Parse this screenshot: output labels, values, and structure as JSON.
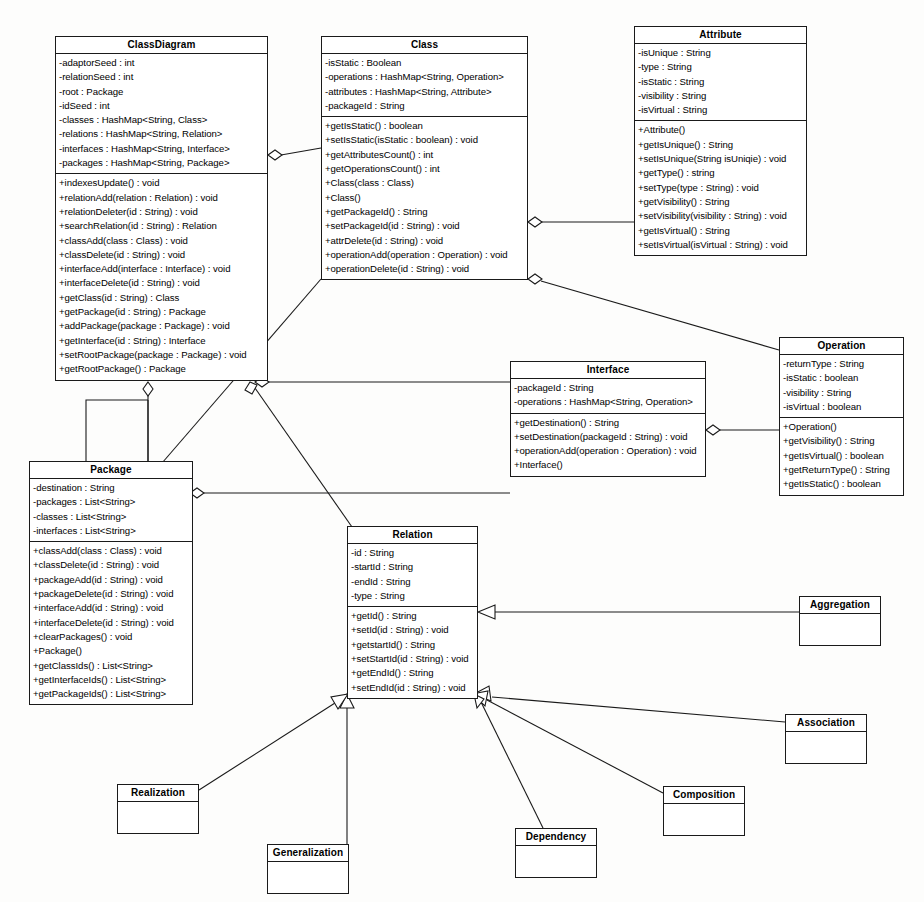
{
  "diagram": {
    "type": "uml-class-diagram",
    "width": 924,
    "height": 902,
    "line_color": "#1a1a1a",
    "background": "#fdfdfc"
  },
  "classes": {
    "class_diagram": {
      "name": "ClassDiagram",
      "x": 55,
      "y": 36,
      "w": 213,
      "h": 346,
      "attributes": [
        "-adaptorSeed : int",
        "-relationSeed : int",
        "-root : Package",
        "-idSeed : int",
        "-classes : HashMap<String, Class>",
        "-relations : HashMap<String, Relation>",
        "-interfaces : HashMap<String, Interface>",
        "-packages : HashMap<String, Package>"
      ],
      "operations": [
        "+indexesUpdate() : void",
        "+relationAdd(relation : Relation) : void",
        "+relationDeleter(id : String) : void",
        "+searchRelation(id : String) : Relation",
        "+classAdd(class : Class) : void",
        "+classDelete(id : String) : void",
        "+interfaceAdd(interface : Interface) : void",
        "+interfaceDelete(id : String) : void",
        "+getClass(id : String) : Class",
        "+getPackage(id : String) : Package",
        "+addPackage(package : Package) : void",
        "+getInterface(id : String) : Interface",
        "+setRootPackage(package : Package) : void",
        "+getRootPackage() : Package"
      ]
    },
    "class": {
      "name": "Class",
      "x": 321,
      "y": 36,
      "w": 207,
      "h": 243,
      "attributes": [
        "-isStatic : Boolean",
        "-operations : HashMap<String, Operation>",
        "-attributes : HashMap<String, Attribute>",
        "-packageId : String"
      ],
      "operations": [
        "+getIsStatic() : boolean",
        "+setIsStatic(isStatic : boolean) : void",
        "+getAttributesCount() : int",
        "+getOperationsCount() : int",
        "+Class(class : Class)",
        "+Class()",
        "+getPackageId() : String",
        "+setPackageId(id : String) : void",
        "+attrDelete(id : String) : void",
        "+operationAdd(operation : Operation) : void",
        "+operationDelete(id : String) : void"
      ]
    },
    "attribute": {
      "name": "Attribute",
      "x": 634,
      "y": 26,
      "w": 173,
      "h": 232,
      "attributes": [
        "-isUnique : String",
        "-type : String",
        "-isStatic : String",
        "-visibility : String",
        "-isVirtual : String"
      ],
      "operations": [
        "+Attribute()",
        "+getIsUnique() : String",
        "+setIsUnique(String isUniqie) : void",
        "+getType() : string",
        "+setType(type : String) : void",
        "+getVisibility() : String",
        "+setVisibility(visibility : String) : void",
        "+getIsVirtual() : String",
        "+setIsVirtual(isVirtual : String) : void"
      ]
    },
    "operation": {
      "name": "Operation",
      "x": 779,
      "y": 337,
      "w": 125,
      "h": 145,
      "attributes": [
        "-returnType : String",
        "-isStatic : boolean",
        "-visibility : String",
        "-isVirtual : boolean"
      ],
      "operations": [
        "+Operation()",
        "+getVisibility() : String",
        "+getIsVirtual() : boolean",
        "+getReturnType() : String",
        "+getIsStatic() : boolean"
      ]
    },
    "interface": {
      "name": "Interface",
      "x": 510,
      "y": 361,
      "w": 196,
      "h": 125,
      "attributes": [
        "-packageId : String",
        "-operations : HashMap<String, Operation>"
      ],
      "operations": [
        "+getDestination() : String",
        "+setDestination(packageId : String) : void",
        "+operationAdd(operation : Operation) : void",
        "+Interface()"
      ]
    },
    "package": {
      "name": "Package",
      "x": 29,
      "y": 461,
      "w": 164,
      "h": 250,
      "attributes": [
        "-destination : String",
        "-packages : List<String>",
        "-classes : List<String>",
        "-interfaces : List<String>"
      ],
      "operations": [
        "+classAdd(class : Class) : void",
        "+classDelete(id : String) : void",
        "+packageAdd(id : String) : void",
        "+packageDelete(id : String) : void",
        "+interfaceAdd(id : String) : void",
        "+interfaceDelete(id : String) : void",
        "+clearPackages() : void",
        "+Package()",
        "+getClassIds() : List<String>",
        "+getInterfaceIds() : List<String>",
        "+getPackageIds() : List<String>"
      ]
    },
    "relation": {
      "name": "Relation",
      "x": 347,
      "y": 526,
      "w": 131,
      "h": 168,
      "attributes": [
        "-id : String",
        "-startId : String",
        "-endId : String",
        "-type : String"
      ],
      "operations": [
        "+getId() : String",
        "+setId(id : String) : void",
        "+getstartId() : String",
        "+setStartId(id : String) : void",
        "+getEndId() : String",
        "+setEndId(id : String) : void"
      ]
    }
  },
  "stubs": [
    {
      "key": "aggregation",
      "name": "Aggregation",
      "x": 799,
      "y": 596,
      "w": 82,
      "h": 36
    },
    {
      "key": "association",
      "name": "Association",
      "x": 785,
      "y": 714,
      "w": 82,
      "h": 36
    },
    {
      "key": "composition",
      "name": "Composition",
      "x": 663,
      "y": 786,
      "w": 82,
      "h": 36
    },
    {
      "key": "dependency",
      "name": "Dependency",
      "x": 515,
      "y": 828,
      "w": 82,
      "h": 36
    },
    {
      "key": "generalization",
      "name": "Generalization",
      "x": 267,
      "y": 844,
      "w": 82,
      "h": 36
    },
    {
      "key": "realization",
      "name": "Realization",
      "x": 117,
      "y": 784,
      "w": 82,
      "h": 36
    }
  ],
  "relationships": [
    {
      "from": "ClassDiagram",
      "to": "Class",
      "kind": "aggregation"
    },
    {
      "from": "Class",
      "to": "Attribute",
      "kind": "aggregation"
    },
    {
      "from": "Class",
      "to": "Operation",
      "kind": "aggregation"
    },
    {
      "from": "Interface",
      "to": "Operation",
      "kind": "aggregation"
    },
    {
      "from": "ClassDiagram",
      "to": "Interface",
      "kind": "aggregation"
    },
    {
      "from": "ClassDiagram",
      "to": "Package",
      "kind": "aggregation"
    },
    {
      "from": "Package",
      "to": "Package",
      "kind": "aggregation"
    },
    {
      "from": "Package",
      "to": "Interface",
      "kind": "aggregation"
    },
    {
      "from": "ClassDiagram",
      "to": "Relation",
      "kind": "aggregation"
    },
    {
      "from": "Class",
      "to": "Relation",
      "kind": "aggregation"
    },
    {
      "from": "Aggregation",
      "to": "Relation",
      "kind": "generalization"
    },
    {
      "from": "Association",
      "to": "Relation",
      "kind": "generalization"
    },
    {
      "from": "Composition",
      "to": "Relation",
      "kind": "generalization"
    },
    {
      "from": "Dependency",
      "to": "Relation",
      "kind": "generalization"
    },
    {
      "from": "Generalization",
      "to": "Relation",
      "kind": "generalization"
    },
    {
      "from": "Realization",
      "to": "Relation",
      "kind": "generalization"
    }
  ]
}
